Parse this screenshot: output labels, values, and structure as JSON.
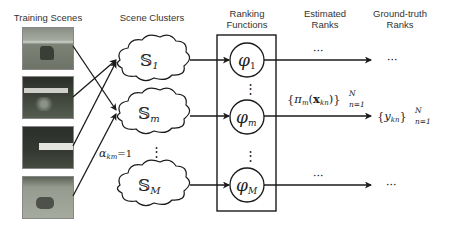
{
  "headers": {
    "training_scenes": "Training Scenes",
    "scene_clusters": "Scene Clusters",
    "ranking_functions_1": "Ranking",
    "ranking_functions_2": "Functions",
    "estimated_ranks_1": "Estimated",
    "estimated_ranks_2": "Ranks",
    "ground_truth_ranks_1": "Ground-truth",
    "ground_truth_ranks_2": "Ranks"
  },
  "training_scenes": [
    {
      "description": "horse on grass field"
    },
    {
      "description": "sports broadcast scene with players"
    },
    {
      "description": "dark field with white banner"
    },
    {
      "description": "animal on grassland"
    }
  ],
  "clusters": [
    {
      "symbol": "𝕊",
      "sub": "1"
    },
    {
      "symbol": "𝕊",
      "sub": "m"
    },
    {
      "symbol": "𝕊",
      "sub": "M"
    }
  ],
  "ranking_functions": [
    {
      "symbol": "φ",
      "sub": "1"
    },
    {
      "symbol": "φ",
      "sub": "m"
    },
    {
      "symbol": "φ",
      "sub": "M"
    }
  ],
  "labels": {
    "alpha": "α",
    "alpha_sub": "km",
    "alpha_eq": "=1",
    "estimated": "{π",
    "estimated_sub": "m",
    "estimated_mid": "(x",
    "estimated_mid_sub": "kn",
    "estimated_end": ")}",
    "estimated_sup": "N",
    "estimated_lower": "n=1",
    "ground_truth": "{y",
    "ground_truth_sub": "kn",
    "ground_truth_end": "}",
    "ground_truth_sup": "N",
    "ground_truth_lower": "n=1",
    "ellipsis": "···",
    "vdots": "⋮"
  },
  "colors": {
    "line": "#1a1a1a",
    "text": "#333333",
    "background": "#ffffff"
  }
}
